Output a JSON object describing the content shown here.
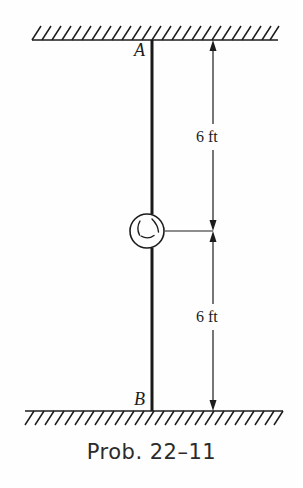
{
  "figure": {
    "caption": "Prob. 22–11",
    "type": "mechanics-free-body-diagram",
    "points": [
      {
        "id": "A",
        "label": "A",
        "position": "top-support"
      },
      {
        "id": "B",
        "label": "B",
        "position": "bottom-support"
      }
    ],
    "dimensions": [
      {
        "id": "upper",
        "label": "6 ft",
        "value": 6,
        "unit": "ft",
        "from": "A",
        "to": "disk"
      },
      {
        "id": "lower",
        "label": "6 ft",
        "value": 6,
        "unit": "ft",
        "from": "disk",
        "to": "B"
      }
    ],
    "supports": [
      {
        "id": "ceiling",
        "style": "hatched-fixed-support",
        "orientation": "top"
      },
      {
        "id": "floor",
        "style": "hatched-fixed-support",
        "orientation": "bottom"
      }
    ],
    "colors": {
      "line": "#1c1c1c",
      "shaft": "#1a1a1a",
      "background": "#fefefe",
      "caption": "#2b2b2b"
    },
    "geometry": {
      "shaft_x": 152,
      "ceiling_y": 40,
      "floor_y": 411,
      "disk_cx": 147,
      "disk_cy": 231,
      "disk_r": 17,
      "dim_x": 213
    }
  }
}
